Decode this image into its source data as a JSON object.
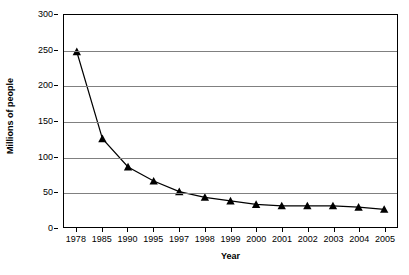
{
  "chart_data": {
    "type": "line",
    "title": "",
    "xlabel": "Year",
    "ylabel": "Millions of people",
    "categories": [
      "1978",
      "1985",
      "1990",
      "1995",
      "1997",
      "1998",
      "1999",
      "2000",
      "2001",
      "2002",
      "2003",
      "2004",
      "2005"
    ],
    "values": [
      248,
      125,
      85,
      65,
      50,
      42,
      37,
      32,
      30,
      30,
      30,
      28,
      25
    ],
    "series": [
      {
        "name": "Millions of people",
        "values": [
          248,
          125,
          85,
          65,
          50,
          42,
          37,
          32,
          30,
          30,
          30,
          28,
          25
        ],
        "marker": "triangle",
        "color": "#000000"
      }
    ],
    "ylim": [
      0,
      300
    ],
    "yticks": [
      0,
      50,
      100,
      150,
      200,
      250,
      300
    ],
    "ytick_labels": [
      "0",
      "50",
      "100",
      "150",
      "200",
      "250",
      "300"
    ],
    "grid": "horizontal",
    "legend": "none",
    "line_color": "#000000",
    "grid_color": "#808080",
    "axis_color": "#000000",
    "background": "#ffffff"
  }
}
